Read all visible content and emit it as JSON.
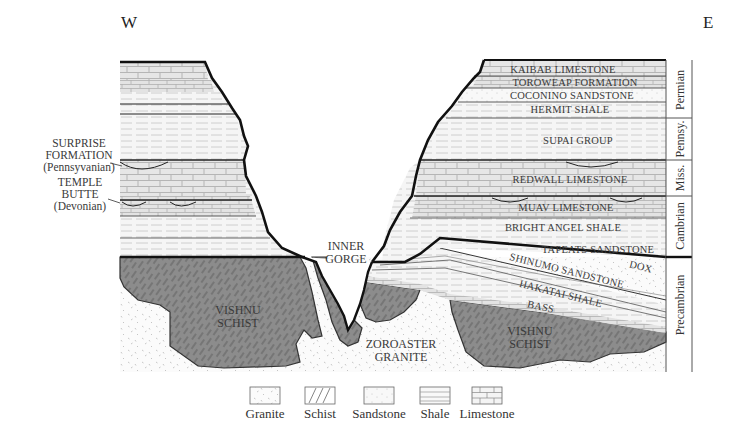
{
  "diagram": {
    "directions": {
      "west": "W",
      "east": "E"
    },
    "right_wall_units": [
      {
        "name": "Kaibab Limestone",
        "label": "KAIBAB LIMESTONE",
        "rock": "limestone"
      },
      {
        "name": "Toroweap Formation",
        "label": "TOROWEAP FORMATION",
        "rock": "limestone"
      },
      {
        "name": "Coconino Sandstone",
        "label": "COCONINO SANDSTONE",
        "rock": "sandstone"
      },
      {
        "name": "Hermit Shale",
        "label": "HERMIT SHALE",
        "rock": "shale"
      },
      {
        "name": "Supai Group",
        "label": "SUPAI GROUP",
        "rock": "shale"
      },
      {
        "name": "Redwall Limestone",
        "label": "REDWALL LIMESTONE",
        "rock": "limestone"
      },
      {
        "name": "Muav Limestone",
        "label": "MUAV LIMESTONE",
        "rock": "limestone"
      },
      {
        "name": "Bright Angel Shale",
        "label": "BRIGHT ANGEL SHALE",
        "rock": "shale"
      },
      {
        "name": "Tapeats Sandstone",
        "label": "TAPEATS SANDSTONE",
        "rock": "sandstone"
      }
    ],
    "precambrian_units": [
      {
        "label": "DOX",
        "rock": "sandstone"
      },
      {
        "label": "SHINUMO SANDSTONE",
        "rock": "sandstone"
      },
      {
        "label": "HAKATAI SHALE",
        "rock": "shale"
      },
      {
        "label": "BASS",
        "rock": "limestone"
      }
    ],
    "left_annotations": [
      {
        "line1": "SURPRISE",
        "line2": "FORMATION",
        "line3": "(Pennsyvanian)"
      },
      {
        "line1": "TEMPLE",
        "line2": "BUTTE",
        "line3": "(Devonian)"
      }
    ],
    "basement": {
      "schist_left": {
        "line1": "VISHNU",
        "line2": "SCHIST"
      },
      "schist_right": {
        "line1": "VISHNU",
        "line2": "SCHIST"
      },
      "granite": {
        "line1": "ZOROASTER",
        "line2": "GRANITE"
      }
    },
    "gorge": {
      "line1": "INNER",
      "line2": "GORGE"
    },
    "periods": [
      {
        "label": "Permian"
      },
      {
        "label": "Pennsy."
      },
      {
        "label": "Miss."
      },
      {
        "label": "Cambrian"
      },
      {
        "label": "Precambrian"
      }
    ]
  },
  "legend": {
    "items": [
      {
        "label": "Granite",
        "pattern": "granite"
      },
      {
        "label": "Schist",
        "pattern": "schist"
      },
      {
        "label": "Sandstone",
        "pattern": "sandstone"
      },
      {
        "label": "Shale",
        "pattern": "shale"
      },
      {
        "label": "Limestone",
        "pattern": "limestone"
      }
    ]
  },
  "colors": {
    "outline": "#111111",
    "schist_fill": "#8a8a8a",
    "limestone_fill": "#e4e4e4",
    "shale_fill": "#f2f2f2",
    "sandstone_fill": "#f7f7f7",
    "label_text": "#3a3a3a"
  }
}
